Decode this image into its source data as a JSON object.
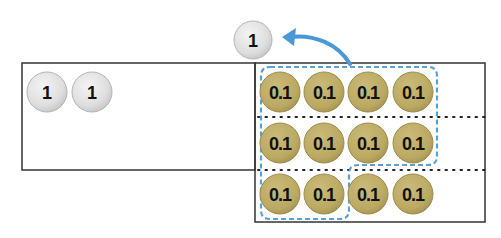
{
  "diagram": {
    "colors": {
      "ones_disc_fill": "#e3e3e3",
      "ones_disc_stroke": "#b5b5b5",
      "tenths_disc_fill": "#bfae6a",
      "tenths_disc_stroke": "#9c8c4f",
      "grouping_outline": "#5aa0d8",
      "arrow": "#4a98d6",
      "frame": "#333333"
    },
    "exchanged_counter": {
      "label": "1"
    },
    "ones_column": {
      "counters": [
        {
          "label": "1"
        },
        {
          "label": "1"
        }
      ]
    },
    "tenths_column": {
      "rows": [
        [
          {
            "label": "0.1"
          },
          {
            "label": "0.1"
          },
          {
            "label": "0.1"
          },
          {
            "label": "0.1"
          }
        ],
        [
          {
            "label": "0.1"
          },
          {
            "label": "0.1"
          },
          {
            "label": "0.1"
          },
          {
            "label": "0.1"
          }
        ],
        [
          {
            "label": "0.1"
          },
          {
            "label": "0.1"
          },
          {
            "label": "0.1"
          },
          {
            "label": "0.1"
          }
        ]
      ],
      "grouped_count": 10
    }
  }
}
